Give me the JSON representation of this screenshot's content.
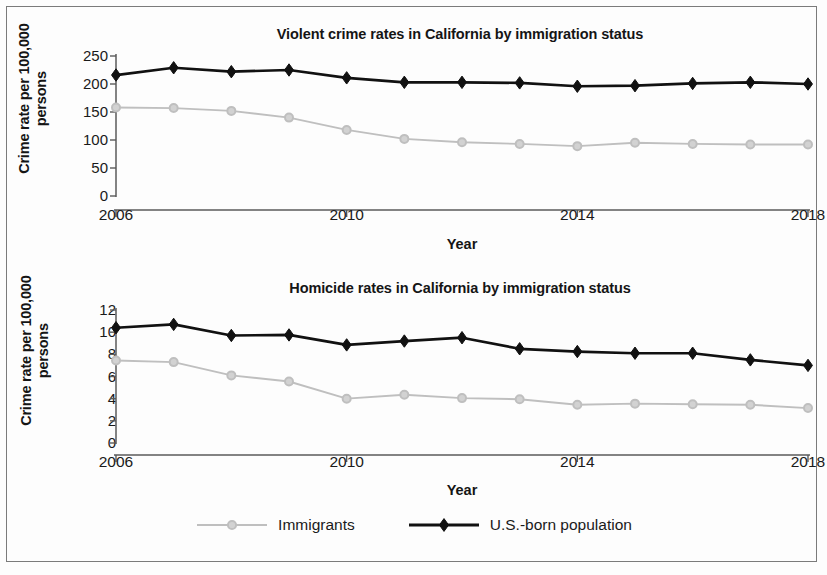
{
  "figure": {
    "border_color": "#7b7b7b",
    "background": "#fdfdfd"
  },
  "legend": {
    "position": "bottom-center",
    "entries": [
      {
        "label": "Immigrants",
        "color": "#bfbfbf",
        "marker": "circle"
      },
      {
        "label": "U.S.-born population",
        "color": "#111111",
        "marker": "diamond"
      }
    ]
  },
  "chart_data": [
    {
      "type": "line",
      "title": "Violent crime rates in California by immigration status",
      "xlabel": "Year",
      "ylabel": "Crime rate per 100,000 persons",
      "ylabel_line1": "Crime rate per 100,000",
      "ylabel_line2": "persons",
      "x": [
        2006,
        2007,
        2008,
        2009,
        2010,
        2011,
        2012,
        2013,
        2014,
        2015,
        2016,
        2017,
        2018
      ],
      "xlim": [
        2006,
        2018
      ],
      "xticks": [
        2006,
        2010,
        2014,
        2018
      ],
      "xtick_labels": [
        "2006",
        "2010",
        "2014",
        "2018"
      ],
      "ylim": [
        0,
        250
      ],
      "yticks": [
        0,
        50,
        100,
        150,
        200,
        250
      ],
      "ytick_labels": [
        "0",
        "50",
        "100",
        "150",
        "200",
        "250"
      ],
      "grid": false,
      "series": [
        {
          "name": "Immigrants",
          "color": "#bfbfbf",
          "marker": "circle",
          "values": [
            158,
            157,
            152,
            140,
            118,
            102,
            96,
            93,
            89,
            95,
            93,
            92,
            92
          ]
        },
        {
          "name": "U.S.-born population",
          "color": "#111111",
          "marker": "diamond",
          "values": [
            216,
            229,
            222,
            225,
            211,
            203,
            203,
            202,
            196,
            197,
            201,
            203,
            200
          ]
        }
      ]
    },
    {
      "type": "line",
      "title": "Homicide rates in California by immigration status",
      "xlabel": "Year",
      "ylabel": "Crime rate per 100,000 persons",
      "ylabel_line1": "Crime rate per 100,000",
      "ylabel_line2": "persons",
      "x": [
        2006,
        2007,
        2008,
        2009,
        2010,
        2011,
        2012,
        2013,
        2014,
        2015,
        2016,
        2017,
        2018
      ],
      "xlim": [
        2006,
        2018
      ],
      "xticks": [
        2006,
        2010,
        2014,
        2018
      ],
      "xtick_labels": [
        "2006",
        "2010",
        "2014",
        "2018"
      ],
      "ylim": [
        0,
        12
      ],
      "yticks": [
        0,
        2,
        4,
        6,
        8,
        10,
        12
      ],
      "ytick_labels": [
        "0",
        "2",
        "4",
        "6",
        "8",
        "10",
        "12"
      ],
      "grid": false,
      "series": [
        {
          "name": "Immigrants",
          "color": "#bfbfbf",
          "marker": "circle",
          "values": [
            7.45,
            7.3,
            6.1,
            5.55,
            4.0,
            4.35,
            4.05,
            3.95,
            3.45,
            3.55,
            3.5,
            3.45,
            3.15
          ]
        },
        {
          "name": "U.S.-born population",
          "color": "#111111",
          "marker": "diamond",
          "values": [
            10.4,
            10.7,
            9.7,
            9.75,
            8.85,
            9.2,
            9.5,
            8.5,
            8.25,
            8.1,
            8.1,
            7.5,
            7.0
          ]
        }
      ]
    }
  ]
}
